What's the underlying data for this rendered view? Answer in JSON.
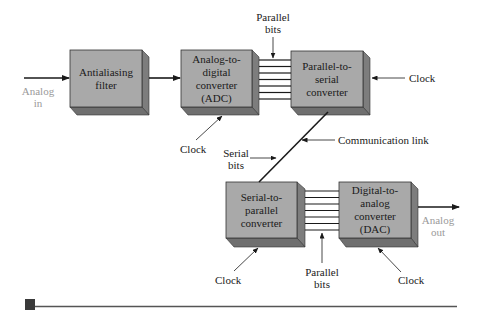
{
  "diagram": {
    "type": "block-diagram",
    "blocks": [
      {
        "id": "antialiasing",
        "label": "Antialiasing\nfilter"
      },
      {
        "id": "adc",
        "label": "Analog-to-\ndigital\nconverter\n(ADC)"
      },
      {
        "id": "p2s",
        "label": "Parallel-to-\nserial\nconverter"
      },
      {
        "id": "s2p",
        "label": "Serial-to-\nparallel\nconverter"
      },
      {
        "id": "dac",
        "label": "Digital-to-\nanalog\nconverter\n(DAC)"
      }
    ],
    "labels": {
      "analog_in": "Analog\nin",
      "analog_out": "Analog\nout",
      "parallel_bits_top": "Parallel\nbits",
      "parallel_bits_bottom": "Parallel\nbits",
      "clock_p2s": "Clock",
      "clock_adc": "Clock",
      "clock_s2p": "Clock",
      "clock_dac": "Clock",
      "serial_bits": "Serial\nbits",
      "communication_link": "Communication link"
    },
    "parallel_line_count": 7,
    "colors": {
      "box_face": "#a9a9a9",
      "box_shadow": "#7d7d7d",
      "line": "#1a1a1a",
      "muted_text": "#9a9a9a"
    }
  }
}
